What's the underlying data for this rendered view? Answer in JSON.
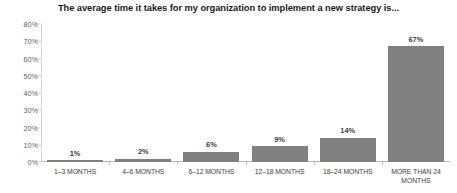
{
  "chart_data": {
    "type": "bar",
    "title": "The average time it takes for my organization to implement a new strategy is...",
    "xlabel": "",
    "ylabel": "",
    "categories": [
      "1–3 MONTHS",
      "4–6 MONTHS",
      "6–12 MONTHS",
      "12–18 MONTHS",
      "18–24 MONTHS",
      "MORE THAN 24 MONTHS"
    ],
    "values": [
      1,
      2,
      6,
      9,
      14,
      67
    ],
    "data_labels": [
      "1%",
      "2%",
      "6%",
      "9%",
      "14%",
      "67%"
    ],
    "ylim": [
      0,
      80
    ],
    "y_ticks": [
      0,
      10,
      20,
      30,
      40,
      50,
      60,
      70,
      80
    ],
    "y_tick_labels": [
      "0%",
      "10%",
      "20%",
      "30%",
      "40%",
      "50%",
      "60%",
      "70%",
      "80%"
    ],
    "grid": false,
    "legend": null,
    "bar_color": "#808080",
    "background_color": "#ffffff",
    "title_color": "#1a1a1a",
    "axis_label_color": "#3d3d3d",
    "tick_label_color": "#5f5f5f"
  }
}
